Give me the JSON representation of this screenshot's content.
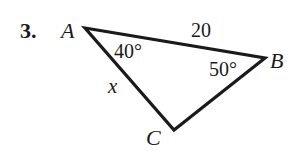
{
  "problem": {
    "number": "3.",
    "vertices": {
      "A": "A",
      "B": "B",
      "C": "C"
    },
    "side_AB": "20",
    "side_AC": "x",
    "angle_A": "40°",
    "angle_B": "50°",
    "stroke_color": "#1a1a1a"
  }
}
